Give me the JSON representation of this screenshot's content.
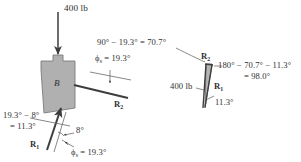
{
  "figure": {
    "domain_note": "engineering statics wedge/friction diagram",
    "background_color": "#ffffff",
    "block_fill": "#b0b0b0",
    "block_stroke": "#6e6e6e",
    "line_color": "#404040",
    "text_color": "#2f2f2f"
  },
  "left_diagram": {
    "name": "free-body-diagram",
    "applied_load_label": "400 lb",
    "block_label": "B",
    "phi_right_label": {
      "symbol": "ϕ",
      "subscript": "s",
      "equals": "=",
      "value": "19.3°",
      "full": "ϕs = 19.3°"
    },
    "reaction_r2_label": {
      "symbol": "R",
      "subscript": "2",
      "full": "R2"
    },
    "angle_difference": {
      "line1": "19.3° − 8°",
      "line2": "= 11.3°"
    },
    "incline_angle_label": "8°",
    "reaction_r1_label": {
      "symbol": "R",
      "subscript": "1",
      "full": "R1"
    },
    "phi_bottom_label": {
      "symbol": "ϕ",
      "subscript": "s",
      "equals": "=",
      "value": "19.3°",
      "full": "ϕs = 19.3°"
    }
  },
  "right_diagram": {
    "name": "force-triangle",
    "top_angle_expression": "90° − 19.3° = 70.7°",
    "r2_label": {
      "symbol": "R",
      "subscript": "2",
      "full": "R2"
    },
    "r1_label": {
      "symbol": "R",
      "subscript": "1",
      "full": "R1"
    },
    "load_label": "400 lb",
    "bottom_angle_label": "11.3°",
    "interior_angle_expression": {
      "line1": "180° − 70.7° − 11.3°",
      "line2": "= 98.0°"
    }
  },
  "values": {
    "phi_s_deg": 19.3,
    "incline_deg": 8,
    "difference_deg": 11.3,
    "complement_deg": 70.7,
    "interior_deg": 98.0,
    "load_lb": 400
  }
}
